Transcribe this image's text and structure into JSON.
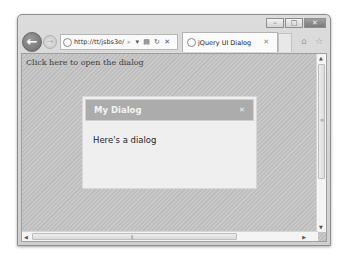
{
  "window": {
    "caption_buttons": {
      "minimize": "–",
      "maximize": "□",
      "close": "✕"
    }
  },
  "nav": {
    "back_icon": "←",
    "forward_icon": "→",
    "address": {
      "url": "http://tt/jsbs3e/",
      "tools": "⌕ ▾ ▤ ↻ ✕"
    },
    "tab": {
      "title": "jQuery UI Dialog",
      "close": "✕"
    },
    "home_icon": "⌂",
    "favorites_icon": "☆"
  },
  "page": {
    "link_text": "Click here to open the dialog",
    "dialog": {
      "title": "My Dialog",
      "close": "✕",
      "body": "Here's a dialog"
    }
  },
  "scrollbars": {
    "up": "▲",
    "down": "▼",
    "left": "◀",
    "right": "▶",
    "grip_v": "≡",
    "grip_h": "⦀"
  }
}
